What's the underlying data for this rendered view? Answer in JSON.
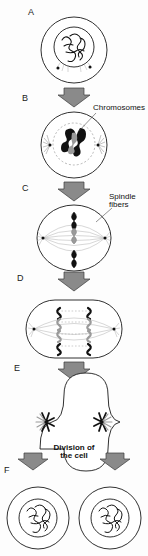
{
  "figure": {
    "width": 148,
    "height": 556,
    "background_color": "#fdfdfd"
  },
  "colors": {
    "outline": "#1a1a1a",
    "arrow_fill": "#8a8a8a",
    "arrow_stroke": "#3a3a3a",
    "chromosome_dark": "#111111",
    "chromosome_gray": "#9a9a9a",
    "spindle_fiber": "#b5b5b5",
    "text": "#111111"
  },
  "stages": [
    {
      "letter": "A",
      "name": "interphase-cell",
      "description": "Round cell with nucleus containing tangled chromatin and two centrioles"
    },
    {
      "letter": "B",
      "name": "prophase-cell",
      "description": "Cell with condensed chromosomes and asters forming at poles"
    },
    {
      "letter": "C",
      "name": "metaphase-cell",
      "description": "Chromosomes aligned at equator with spindle fibers from two poles"
    },
    {
      "letter": "D",
      "name": "anaphase-cell",
      "description": "Elongated cell with chromatids separating toward opposite poles"
    },
    {
      "letter": "E",
      "name": "telophase-cell",
      "description": "Cell pinching in two with cleavage furrow and asters at each pole"
    },
    {
      "letter": "F",
      "name": "daughter-cells",
      "description": "Two separate daughter cells each with a nucleus"
    }
  ],
  "annotations": {
    "chromosomes_label": "Chromosomes",
    "spindle_fibers_label": "Spindle\nfibers",
    "division_label": "Division of\nthe cell"
  },
  "arrows": [
    {
      "name": "arrow-a-to-b",
      "direction": "down"
    },
    {
      "name": "arrow-b-to-c",
      "direction": "down"
    },
    {
      "name": "arrow-c-to-d",
      "direction": "down"
    },
    {
      "name": "arrow-d-to-e",
      "direction": "down"
    },
    {
      "name": "arrow-e-to-f-left",
      "direction": "down"
    },
    {
      "name": "arrow-e-to-f-right",
      "direction": "down"
    }
  ]
}
